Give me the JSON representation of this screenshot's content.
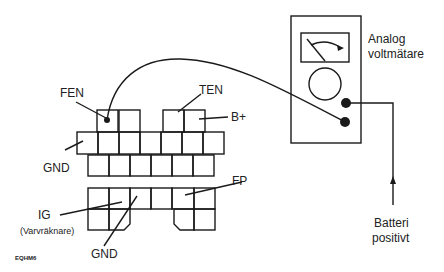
{
  "diagram": {
    "figure_code": "EQHM6",
    "colors": {
      "ink": "#1a1a1a",
      "background": "#ffffff"
    },
    "meter": {
      "label_line1": "Analog",
      "label_line2": "voltmätare"
    },
    "battery": {
      "label_line1": "Batteri",
      "label_line2": "positivt"
    },
    "connector_labels": {
      "fen": "FEN",
      "ten": "TEN",
      "b_plus": "B+",
      "gnd_upper": "GND",
      "fp": "FP",
      "ig": "IG",
      "ig_note": "(Varvräknare)",
      "gnd_lower": "GND"
    }
  }
}
